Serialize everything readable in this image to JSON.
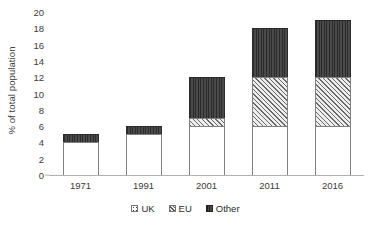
{
  "chart_data": {
    "type": "bar",
    "stacked": true,
    "title": "",
    "subtitle": "",
    "xlabel": "",
    "ylabel": "% of total population",
    "categories": [
      "1971",
      "1991",
      "2001",
      "2011",
      "2016"
    ],
    "series": [
      {
        "name": "UK",
        "values": [
          4,
          5,
          6,
          6,
          6
        ]
      },
      {
        "name": "EU",
        "values": [
          0,
          0,
          1,
          6,
          6
        ]
      },
      {
        "name": "Other",
        "values": [
          1,
          1,
          5,
          6,
          7
        ]
      }
    ],
    "totals": [
      5,
      6,
      12,
      18,
      19
    ],
    "ylim": [
      0,
      20
    ],
    "ytick_step": 2,
    "ytick_labels": [
      "0",
      "2",
      "4",
      "6",
      "8",
      "10",
      "12",
      "14",
      "16",
      "18",
      "20"
    ],
    "grid": false,
    "legend_position": "bottom",
    "annotations": []
  },
  "legend": {
    "items": [
      {
        "label": "UK",
        "swatch": "dotted-pattern-swatch",
        "color": "#ffffff"
      },
      {
        "label": "EU",
        "swatch": "hatched-pattern-swatch",
        "color": "#e6e6e6"
      },
      {
        "label": "Other",
        "swatch": "dark-pattern-swatch",
        "color": "#3a3a3a"
      }
    ]
  },
  "axes": {
    "y_title": "% of total population",
    "axis_color": "#b0b0b0",
    "text_color": "#3b3b3b"
  }
}
